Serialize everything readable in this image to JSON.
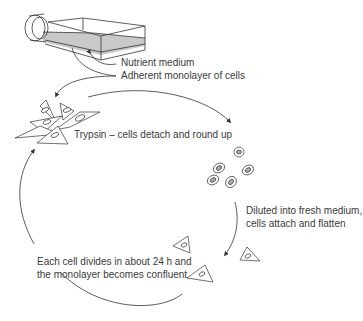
{
  "diagram": {
    "colors": {
      "line": "#333333",
      "medium_fill": "#c9c9c9",
      "text": "#3a3a3a"
    },
    "flask_labels": {
      "nutrient": "Nutrient medium",
      "monolayer": "Adherent monolayer of cells"
    },
    "steps": [
      {
        "id": "trypsin",
        "text": "Trypsin – cells detach and round up"
      },
      {
        "id": "dilute_line1",
        "text": "Diluted into fresh medium,"
      },
      {
        "id": "dilute_line2",
        "text": "cells attach and flatten"
      },
      {
        "id": "divide_line1",
        "text": "Each cell divides in about 24 h and"
      },
      {
        "id": "divide_line2",
        "text": "the monolayer becomes confluent"
      }
    ]
  }
}
